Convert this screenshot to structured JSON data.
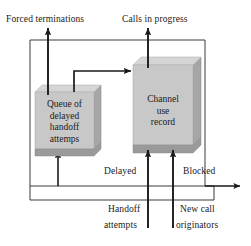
{
  "diagram": {
    "boxes": [
      {
        "id": "queue",
        "name": "queue-of-delayed-handoff-attempts-box",
        "lines": [
          "Queue of",
          "delayed",
          "handoff",
          "attemps"
        ],
        "x": 35,
        "y": 92,
        "w": 59,
        "h": 57,
        "depth": 7,
        "face_color": "#c8c8c8",
        "top_color": "#d8d8d8",
        "side_color": "#a6a6a6"
      },
      {
        "id": "channel",
        "name": "channel-use-record-box",
        "lines": [
          "Channel",
          "use",
          "record"
        ],
        "x": 133,
        "y": 65,
        "w": 60,
        "h": 80,
        "depth": 8,
        "face_color": "#c8c8c8",
        "top_color": "#d8d8d8",
        "side_color": "#a6a6a6"
      }
    ],
    "labels": {
      "forced_terminations": "Forced terminations",
      "calls_in_progress": "Calls in progress",
      "delayed": "Delayed",
      "blocked": "Blocked",
      "handoff_attempts_line1": "Handoff",
      "handoff_attempts_line2": "attempts",
      "new_call_originators_line1": "New call",
      "new_call_originators_line2": "originators"
    },
    "colors": {
      "line": "#1a1a1a",
      "thin_line": "#3a3a3a",
      "background": "#ffffff"
    }
  }
}
